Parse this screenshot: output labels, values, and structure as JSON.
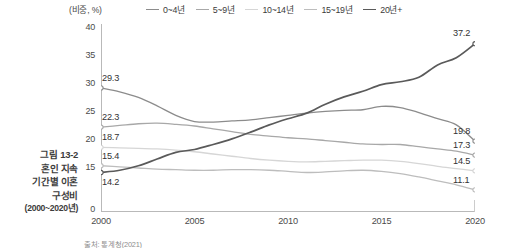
{
  "figure": {
    "caption_lines": [
      "그림 13-2",
      "혼인 지속",
      "기간별 이혼",
      "구성비"
    ],
    "caption_years": "(2000~2020년)",
    "unit_label": "(비중, %)",
    "source_note": "출처: 통계청(2021)"
  },
  "chart_data": {
    "type": "line",
    "title": "혼인 지속 기간별 이혼 구성비",
    "xlabel": "",
    "ylabel": "(비중, %)",
    "x": [
      2000,
      2001,
      2002,
      2003,
      2004,
      2005,
      2006,
      2007,
      2008,
      2009,
      2010,
      2011,
      2012,
      2013,
      2014,
      2015,
      2016,
      2017,
      2018,
      2019,
      2020
    ],
    "xticks": [
      "2000",
      "2005",
      "2010",
      "2015",
      "2020"
    ],
    "xtick_values": [
      2000,
      2005,
      2010,
      2015,
      2020
    ],
    "yticks": [
      "0",
      "15",
      "20",
      "25",
      "30",
      "35",
      "40"
    ],
    "ytick_values": [
      0,
      15,
      20,
      25,
      30,
      35,
      40
    ],
    "ylim": [
      0,
      40
    ],
    "xlim": [
      2000,
      2020
    ],
    "grid": false,
    "legend_position": "top",
    "series": [
      {
        "name": "0~4년",
        "color": "#8c8c8c",
        "start_label": "29.3",
        "end_label": "19.8",
        "values": [
          29.3,
          28.6,
          27.6,
          26.1,
          24.4,
          23.3,
          23.2,
          23.4,
          23.6,
          24.0,
          24.4,
          24.8,
          25.1,
          25.3,
          25.4,
          26.0,
          25.8,
          24.9,
          23.8,
          22.7,
          19.8
        ]
      },
      {
        "name": "5~9년",
        "color": "#a8a8a8",
        "start_label": "22.3",
        "end_label": "17.3",
        "values": [
          22.3,
          22.6,
          22.9,
          23.0,
          22.8,
          22.5,
          22.0,
          21.5,
          21.0,
          20.7,
          20.4,
          20.2,
          19.9,
          19.6,
          19.3,
          19.2,
          19.2,
          18.8,
          18.4,
          18.0,
          17.3
        ]
      },
      {
        "name": "10~14년",
        "color": "#d6d6d6",
        "start_label": "18.7",
        "end_label": "14.5",
        "values": [
          18.7,
          18.6,
          18.5,
          18.4,
          18.2,
          17.9,
          17.5,
          17.1,
          16.7,
          16.4,
          16.2,
          16.1,
          16.2,
          16.3,
          16.4,
          16.4,
          16.2,
          15.8,
          15.3,
          14.9,
          14.5
        ]
      },
      {
        "name": "15~19년",
        "color": "#bdbdbd",
        "start_label": "15.4",
        "end_label": "11.1",
        "values": [
          15.4,
          15.2,
          15.0,
          14.8,
          14.7,
          14.6,
          14.6,
          14.7,
          14.7,
          14.6,
          14.4,
          14.2,
          14.3,
          14.5,
          14.6,
          14.4,
          14.0,
          13.4,
          12.7,
          12.0,
          11.1
        ]
      },
      {
        "name": "20년+",
        "color": "#5a5a5a",
        "start_label": "14.2",
        "end_label": "37.2",
        "values": [
          14.2,
          14.6,
          15.4,
          16.6,
          17.8,
          18.3,
          19.2,
          20.2,
          21.4,
          22.7,
          23.8,
          24.8,
          26.4,
          27.7,
          28.7,
          29.9,
          30.4,
          31.2,
          33.4,
          34.7,
          37.2
        ]
      }
    ]
  }
}
